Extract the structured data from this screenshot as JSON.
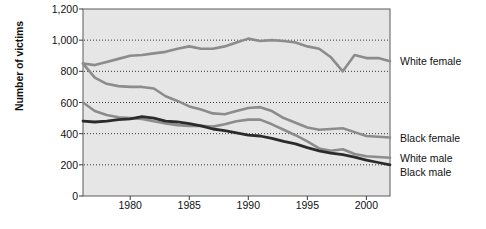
{
  "chart_data": {
    "type": "line",
    "title": "",
    "xlabel": "",
    "ylabel": "Number of victims",
    "xlim": [
      1976,
      2002
    ],
    "ylim": [
      0,
      1200
    ],
    "grid": "horizontal-dotted",
    "legend_position": "right-inline",
    "y_ticks": [
      "0",
      "200",
      "400",
      "600",
      "800",
      "1,000",
      "1,200"
    ],
    "y_tick_values": [
      0,
      200,
      400,
      600,
      800,
      1000,
      1200
    ],
    "x_ticks": [
      "1980",
      "1985",
      "1990",
      "1995",
      "2000"
    ],
    "x_tick_values": [
      1980,
      1985,
      1990,
      1995,
      2000
    ],
    "x": [
      1976,
      1977,
      1978,
      1979,
      1980,
      1981,
      1982,
      1983,
      1984,
      1985,
      1986,
      1987,
      1988,
      1989,
      1990,
      1991,
      1992,
      1993,
      1994,
      1995,
      1996,
      1997,
      1998,
      1999,
      2000,
      2001,
      2002
    ],
    "series": [
      {
        "name": "White female",
        "color": "#8c8c8c",
        "width": 2.6,
        "values": [
          850,
          840,
          860,
          880,
          900,
          905,
          915,
          925,
          945,
          960,
          945,
          945,
          960,
          985,
          1010,
          995,
          1000,
          995,
          985,
          960,
          945,
          890,
          800,
          905,
          885,
          885,
          865
        ]
      },
      {
        "name": "Black female",
        "color": "#8c8c8c",
        "width": 2.6,
        "values": [
          850,
          760,
          720,
          705,
          700,
          700,
          690,
          640,
          610,
          575,
          555,
          530,
          525,
          545,
          565,
          570,
          545,
          500,
          470,
          440,
          425,
          430,
          435,
          410,
          385,
          380,
          375
        ]
      },
      {
        "name": "White male",
        "color": "#8c8c8c",
        "width": 2.6,
        "values": [
          600,
          545,
          520,
          505,
          500,
          495,
          480,
          465,
          455,
          450,
          450,
          445,
          460,
          480,
          490,
          490,
          460,
          425,
          390,
          350,
          305,
          290,
          300,
          270,
          255,
          250,
          245
        ]
      },
      {
        "name": "Black male",
        "color": "#2b2b2b",
        "width": 2.8,
        "values": [
          480,
          475,
          480,
          490,
          495,
          510,
          500,
          480,
          475,
          465,
          450,
          430,
          420,
          405,
          390,
          385,
          370,
          350,
          335,
          310,
          290,
          275,
          265,
          250,
          230,
          215,
          200
        ]
      }
    ]
  },
  "axis": {
    "y_title": "Number of victims"
  },
  "legend": {
    "items": [
      {
        "label": "White female"
      },
      {
        "label": "Black female"
      },
      {
        "label": "White male"
      },
      {
        "label": "Black male"
      }
    ]
  }
}
